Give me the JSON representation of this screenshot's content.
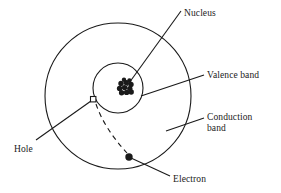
{
  "figure": {
    "background_color": "#ffffff",
    "stroke_color": "#1a1a1a"
  },
  "labels": {
    "nucleus": "Nucleus",
    "valence_band": "Valence band",
    "conduction_band": "Conduction\nband",
    "hole": "Hole",
    "electron": "Electron"
  },
  "shapes": {
    "outer_orbit": {
      "name": "conduction-band-orbit",
      "cx": 118,
      "cy": 96,
      "r": 73
    },
    "inner_orbit": {
      "name": "valence-band-orbit",
      "cx": 118,
      "cy": 88,
      "r": 25
    },
    "nucleus_cluster": {
      "cx": 126,
      "cy": 88,
      "particle_count": 9,
      "particle_r": 2.6
    },
    "hole_marker": {
      "shape": "square",
      "cx": 93,
      "cy": 99,
      "size": 5,
      "fill": "#ffffff"
    },
    "electron_marker": {
      "shape": "circle",
      "cx": 129,
      "cy": 157,
      "r": 3.6,
      "fill": "#1a1a1a"
    },
    "transition_path": {
      "style": "dashed",
      "from": [
        96,
        103
      ],
      "to": [
        127,
        153
      ]
    }
  },
  "leader_lines": {
    "nucleus": {
      "x1": 181,
      "y1": 11,
      "x2": 124,
      "y2": 90
    },
    "valence": {
      "x1": 204,
      "y1": 75,
      "x2": 141,
      "y2": 96
    },
    "conduction": {
      "x1": 204,
      "y1": 118,
      "x2": 166,
      "y2": 131
    },
    "hole": {
      "x1": 36,
      "y1": 140,
      "x2": 91,
      "y2": 101
    },
    "electron": {
      "x1": 170,
      "y1": 176,
      "x2": 131,
      "y2": 158
    }
  }
}
